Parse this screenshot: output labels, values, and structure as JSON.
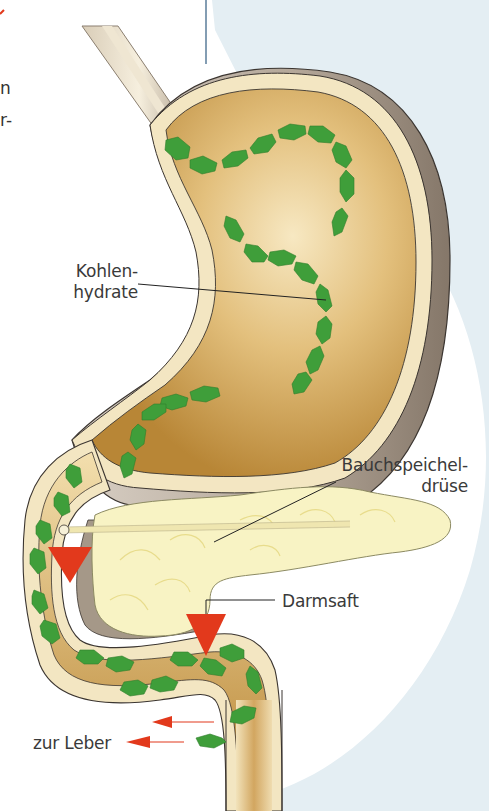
{
  "figure": {
    "colors": {
      "background_blue": "#e4eef3",
      "organ_wall": "#f3e6c2",
      "organ_inner": "#c99a4d",
      "organ_shadow": "#9c8e80",
      "pancreas": "#f8f3c4",
      "carbohydrate_chain": "#3f9e3a",
      "enzyme_arrow": "#e2391c",
      "outline": "#3b3530",
      "label_text": "#3a3a3a"
    }
  },
  "cut_off_text": {
    "line1": "n",
    "line2": "r-"
  },
  "labels": {
    "carbohydrates_line1": "Kohlen-",
    "carbohydrates_line2": "hydrate",
    "pancreas_line1": "Bauchspeichel-",
    "pancreas_line2": "drüse",
    "intestinal_juice": "Darmsaft",
    "to_liver": "zur Leber"
  }
}
